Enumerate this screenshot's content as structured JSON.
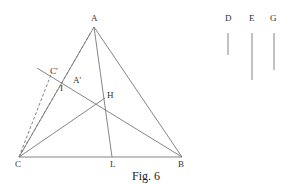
{
  "figure": {
    "caption": "Fig. 6",
    "points": {
      "A": {
        "label": "A"
      },
      "B": {
        "label": "B"
      },
      "C": {
        "label": "C"
      },
      "H": {
        "label": "H"
      },
      "L": {
        "label": "L"
      },
      "I": {
        "label": "I"
      },
      "C_prime": {
        "label": "C'"
      },
      "A_prime": {
        "label": "A'"
      }
    },
    "segments": {
      "D": {
        "label": "D"
      },
      "E": {
        "label": "E"
      },
      "G": {
        "label": "G"
      }
    }
  }
}
